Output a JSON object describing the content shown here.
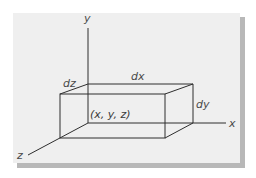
{
  "diagram": {
    "axes": {
      "x_label": "x",
      "y_label": "y",
      "z_label": "z"
    },
    "box_labels": {
      "dx": "dx",
      "dy": "dy",
      "dz": "dz",
      "corner": "(x, y, z)"
    },
    "colors": {
      "panel": "#efefef",
      "shadow": "#b8b8b8",
      "line": "#2e2e2e",
      "text": "#4a4a4a"
    }
  }
}
